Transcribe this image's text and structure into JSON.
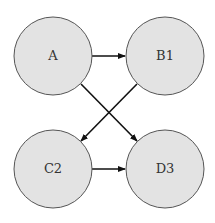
{
  "diagram": {
    "type": "directed-graph",
    "colors": {
      "node_fill": "#e3e3e3",
      "node_stroke": "#555555",
      "edge": "#111111",
      "label": "#333333"
    },
    "nodes": [
      {
        "id": "A",
        "label": "A",
        "cx": 53,
        "cy": 56,
        "r": 39
      },
      {
        "id": "B1",
        "label": "B1",
        "cx": 165,
        "cy": 56,
        "r": 39
      },
      {
        "id": "C2",
        "label": "C2",
        "cx": 53,
        "cy": 169,
        "r": 39
      },
      {
        "id": "D3",
        "label": "D3",
        "cx": 165,
        "cy": 169,
        "r": 39
      }
    ],
    "edges": [
      {
        "from": "A",
        "to": "B1"
      },
      {
        "from": "A",
        "to": "D3"
      },
      {
        "from": "B1",
        "to": "C2"
      },
      {
        "from": "C2",
        "to": "D3"
      }
    ]
  }
}
